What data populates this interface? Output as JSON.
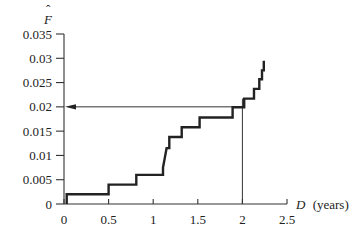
{
  "chart_data": {
    "type": "line",
    "subtype": "step",
    "title": "",
    "xlabel": "D (years)",
    "xlabel_var": "D",
    "xlabel_unit": "(years)",
    "ylabel": "F̂",
    "xlim": [
      0,
      2.5
    ],
    "ylim": [
      0,
      0.035
    ],
    "x_ticks": [
      "0",
      "0.5",
      "1",
      "1.5",
      "2",
      "2.5"
    ],
    "y_ticks": [
      "0",
      "0.005",
      "0.01",
      "0.015",
      "0.02",
      "0.025",
      "0.03",
      "0.035"
    ],
    "grid": false,
    "legend": null,
    "series": [
      {
        "name": "Empirical CDF estimate",
        "points": [
          [
            0.03,
            0
          ],
          [
            0.03,
            0.002
          ],
          [
            0.5,
            0.002
          ],
          [
            0.5,
            0.004
          ],
          [
            0.81,
            0.004
          ],
          [
            0.81,
            0.006
          ],
          [
            1.11,
            0.006
          ],
          [
            1.11,
            0.0075
          ],
          [
            1.12,
            0.0085
          ],
          [
            1.13,
            0.0095
          ],
          [
            1.14,
            0.0105
          ],
          [
            1.15,
            0.0115
          ],
          [
            1.18,
            0.0115
          ],
          [
            1.18,
            0.0138
          ],
          [
            1.32,
            0.0138
          ],
          [
            1.32,
            0.0158
          ],
          [
            1.52,
            0.0158
          ],
          [
            1.52,
            0.0178
          ],
          [
            1.89,
            0.0178
          ],
          [
            1.89,
            0.0199
          ],
          [
            2.02,
            0.0199
          ],
          [
            2.02,
            0.0217
          ],
          [
            2.13,
            0.0217
          ],
          [
            2.13,
            0.0237
          ],
          [
            2.19,
            0.0237
          ],
          [
            2.19,
            0.0257
          ],
          [
            2.22,
            0.0257
          ],
          [
            2.22,
            0.0275
          ],
          [
            2.24,
            0.0275
          ],
          [
            2.24,
            0.0295
          ]
        ]
      }
    ],
    "annotations": [
      {
        "type": "vertical-line",
        "x": 2.0,
        "from_y": 0,
        "to_y": 0.0217
      },
      {
        "type": "arrow",
        "from": [
          2.0,
          0.02
        ],
        "to": [
          0,
          0.02
        ],
        "direction": "left"
      }
    ]
  }
}
